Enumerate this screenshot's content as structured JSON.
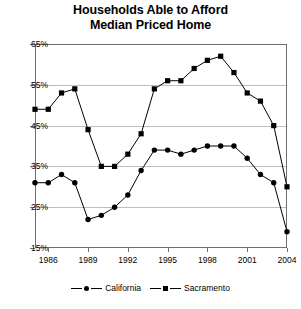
{
  "chart_data": {
    "type": "line",
    "title": "Households Able to Afford Median Priced Home",
    "title_line1": "Households Able to Afford",
    "title_line2": "Median Priced Home",
    "xlabel": "",
    "ylabel": "",
    "ylim": [
      15,
      65
    ],
    "ytick_values": [
      15,
      25,
      35,
      45,
      55,
      65
    ],
    "ytick_labels": [
      "15%",
      "25%",
      "35%",
      "45%",
      "55%",
      "65%"
    ],
    "grid": true,
    "grid_axis": "y",
    "legend_position": "bottom",
    "xlim": [
      1985,
      2004
    ],
    "x": [
      1985,
      1986,
      1987,
      1988,
      1989,
      1990,
      1991,
      1992,
      1993,
      1994,
      1995,
      1996,
      1997,
      1998,
      1999,
      2000,
      2001,
      2002,
      2003,
      2004
    ],
    "xtick_values": [
      1986,
      1989,
      1992,
      1995,
      1998,
      2001,
      2004
    ],
    "xtick_labels": [
      "1986",
      "1989",
      "1992",
      "1995",
      "1998",
      "2001",
      "2004"
    ],
    "series": [
      {
        "name": "California",
        "marker": "circle",
        "color": "#000000",
        "values": [
          31,
          31,
          33,
          31,
          22,
          23,
          25,
          28,
          34,
          39,
          39,
          38,
          39,
          40,
          40,
          40,
          37,
          33,
          31,
          19
        ]
      },
      {
        "name": "Sacramento",
        "marker": "square",
        "color": "#000000",
        "values": [
          49,
          49,
          53,
          54,
          44,
          35,
          35,
          38,
          43,
          54,
          56,
          56,
          59,
          61,
          62,
          58,
          53,
          51,
          45,
          30
        ]
      }
    ]
  },
  "legend": {
    "items": [
      {
        "label": "California",
        "marker": "circle"
      },
      {
        "label": "Sacramento",
        "marker": "square"
      }
    ]
  }
}
